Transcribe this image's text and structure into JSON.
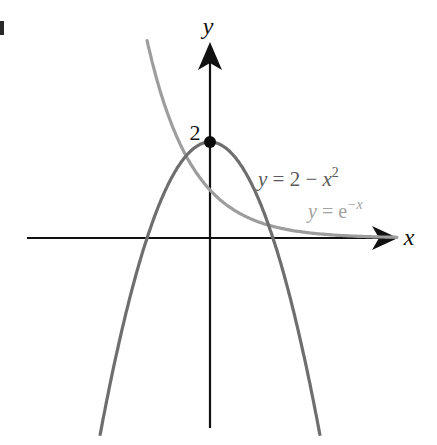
{
  "chart_data": {
    "type": "line",
    "title": "",
    "xlabel": "x",
    "ylabel": "y",
    "grid": false,
    "legend": "inline labels on curves",
    "axes": {
      "origin_px": [
        210,
        238
      ],
      "x_scale_px_per_unit": 44.5,
      "y_scale_px_per_unit": 48,
      "xlim": [
        -4.1,
        4.2
      ],
      "ylim": [
        -4.2,
        4.3
      ]
    },
    "series": [
      {
        "name": "y = 2 − x²",
        "label_parts": {
          "lhs": "y",
          "eq": " = 2 − ",
          "var": "x",
          "sup": "2"
        },
        "formula": "2 - x^2",
        "color": "#6e6e6e",
        "x_range": [
          -2.55,
          2.55
        ],
        "key_points": [
          [
            -1.414,
            0
          ],
          [
            0,
            2
          ],
          [
            1.414,
            0
          ]
        ]
      },
      {
        "name": "y = e^(−x)",
        "label_parts": {
          "lhs": "y",
          "eq": " = e",
          "sup": "−x"
        },
        "formula": "exp(-x)",
        "color": "#9d9d9d",
        "x_range": [
          -1.5,
          4.2
        ],
        "key_points": [
          [
            0,
            1
          ]
        ]
      }
    ],
    "annotations": [
      {
        "text": "2",
        "at": [
          0,
          2
        ],
        "type": "point-label",
        "marker": "filled-circle"
      }
    ]
  },
  "labels": {
    "x_axis": "x",
    "y_axis": "y",
    "y_intercept": "2",
    "parabola": {
      "lhs": "y",
      "eq": " = 2 − ",
      "var": "x",
      "sup": "2"
    },
    "exponential": {
      "lhs": "y",
      "eq": " = e",
      "sup": "−x"
    }
  },
  "colors": {
    "axes": "#111111",
    "parabola": "#6e6e6e",
    "exponential": "#9d9d9d",
    "parabola_label": "#5a5a5a",
    "exponential_label": "#a2a2a2",
    "point": "#0a0a0a"
  }
}
